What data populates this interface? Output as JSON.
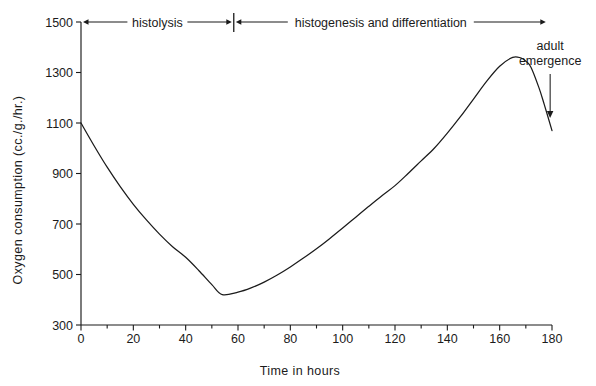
{
  "chart_data": {
    "type": "line",
    "title": "",
    "xlabel": "Time in  hours",
    "ylabel": "Oxygen consumption (cc./g./hr.)",
    "xlim": [
      0,
      180
    ],
    "ylim": [
      300,
      1500
    ],
    "grid": false,
    "legend": "none",
    "x_ticks_major": [
      0,
      20,
      40,
      60,
      80,
      100,
      120,
      140,
      160,
      180
    ],
    "x_tick_labels": [
      "0",
      "20",
      "40",
      "60",
      "80",
      "100",
      "120",
      "140",
      "160",
      "180"
    ],
    "x_ticks_minor": [
      10,
      30,
      50,
      70,
      90,
      110,
      130,
      150,
      170
    ],
    "y_ticks": [
      300,
      500,
      700,
      900,
      1100,
      1300,
      1500
    ],
    "y_tick_labels": [
      "300",
      "500",
      "700",
      "900",
      "1100",
      "1300",
      "1500"
    ],
    "series": [
      {
        "name": "Oxygen consumption",
        "color": "#1b1b1b",
        "x": [
          0,
          5,
          10,
          15,
          20,
          25,
          30,
          35,
          40,
          45,
          50,
          54,
          60,
          65,
          70,
          75,
          80,
          85,
          90,
          95,
          100,
          105,
          110,
          115,
          120,
          125,
          130,
          135,
          140,
          145,
          150,
          155,
          160,
          165,
          168,
          170,
          172,
          175,
          177,
          180
        ],
        "y": [
          1100,
          1010,
          925,
          848,
          778,
          716,
          660,
          610,
          568,
          516,
          460,
          420,
          430,
          447,
          470,
          498,
          530,
          565,
          602,
          642,
          684,
          727,
          770,
          812,
          852,
          900,
          950,
          1000,
          1060,
          1125,
          1195,
          1265,
          1325,
          1360,
          1358,
          1345,
          1320,
          1240,
          1175,
          1070
        ]
      }
    ],
    "annotations": [
      {
        "id": "histolysis",
        "label": "histolysis",
        "kind": "double-arrow-span",
        "x_start": 0,
        "x_end": 58,
        "y_value": 1500
      },
      {
        "id": "histogenesis",
        "label": "histogenesis and differentiation",
        "kind": "double-arrow-span",
        "x_start": 58,
        "x_end": 178,
        "y_value": 1500
      },
      {
        "id": "adult-emergence",
        "label_line1": "adult",
        "label_line2": "emergence",
        "kind": "down-arrow",
        "x_value": 177,
        "y_top": 1360,
        "y_bottom": 1120
      }
    ]
  },
  "chart_meta": {
    "background_color": "#ffffff",
    "ink_color": "#1b1b1b"
  }
}
